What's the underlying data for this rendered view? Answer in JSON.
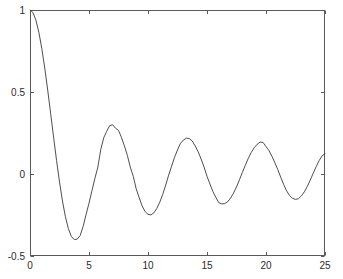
{
  "chart_data": {
    "type": "line",
    "title": "",
    "subtitle": "",
    "xlabel": "",
    "ylabel": "",
    "xlim": [
      0,
      25
    ],
    "ylim": [
      -0.5,
      1
    ],
    "grid": false,
    "legend": null,
    "legend_position": "none",
    "xticks": [
      0,
      5,
      10,
      15,
      20,
      25
    ],
    "xtick_labels": [
      "0",
      "5",
      "10",
      "15",
      "20",
      "25"
    ],
    "yticks": [
      -0.5,
      0,
      0.5,
      1
    ],
    "ytick_labels": [
      "-0.5",
      "0",
      "0.5",
      "1"
    ],
    "line_color": "#3a3a3a",
    "line_width": 0.9,
    "axis_color": "#5a5a5a",
    "background_color": "#ffffff",
    "annotations": [
      {
        "label": "start",
        "x": 0,
        "y": 1.0
      },
      {
        "label": "first-minimum",
        "x": 3.8,
        "y": -0.403
      },
      {
        "label": "first-maximum",
        "x": 6.7,
        "y": 0.3
      },
      {
        "label": "second-minimum",
        "x": 10.0,
        "y": -0.25
      },
      {
        "label": "second-maximum",
        "x": 13.15,
        "y": 0.22
      },
      {
        "label": "third-minimum",
        "x": 16.4,
        "y": -0.18
      },
      {
        "label": "third-maximum",
        "x": 19.5,
        "y": 0.195
      },
      {
        "label": "fourth-minimum",
        "x": 22.6,
        "y": -0.155
      },
      {
        "label": "end",
        "x": 25,
        "y": 0.12
      }
    ],
    "series": [
      {
        "name": "damped oscillation",
        "x": [
          0,
          0.25,
          0.5,
          0.75,
          1,
          1.25,
          1.5,
          1.75,
          2,
          2.25,
          2.5,
          2.75,
          3,
          3.25,
          3.5,
          3.75,
          4,
          4.25,
          4.5,
          4.75,
          5,
          5.25,
          5.5,
          5.75,
          6,
          6.25,
          6.5,
          6.75,
          7,
          7.25,
          7.5,
          7.75,
          8,
          8.25,
          8.5,
          8.75,
          9,
          9.25,
          9.5,
          9.75,
          10,
          10.25,
          10.5,
          10.75,
          11,
          11.25,
          11.5,
          11.75,
          12,
          12.25,
          12.5,
          12.75,
          13,
          13.25,
          13.5,
          13.75,
          14,
          14.25,
          14.5,
          14.75,
          15,
          15.25,
          15.5,
          15.75,
          16,
          16.25,
          16.5,
          16.75,
          17,
          17.25,
          17.5,
          17.75,
          18,
          18.25,
          18.5,
          18.75,
          19,
          19.25,
          19.5,
          19.75,
          20,
          20.25,
          20.5,
          20.75,
          21,
          21.25,
          21.5,
          21.75,
          22,
          22.25,
          22.5,
          22.75,
          23,
          23.25,
          23.5,
          23.75,
          24,
          24.25,
          24.5,
          24.75,
          25
        ],
        "y": [
          1,
          0.9844,
          0.9385,
          0.8642,
          0.7652,
          0.6459,
          0.5118,
          0.369,
          0.2239,
          0.0827,
          -0.0484,
          -0.1641,
          -0.2601,
          -0.3331,
          -0.3801,
          -0.4,
          -0.3971,
          -0.3754,
          -0.3205,
          -0.2478,
          -0.1776,
          -0.1018,
          -0.0268,
          0.042,
          0.1506,
          0.2214,
          0.2601,
          0.2951,
          0.3001,
          0.2786,
          0.2663,
          0.2234,
          0.1717,
          0.1137,
          0.0419,
          -0.0142,
          -0.0903,
          -0.1437,
          -0.1939,
          -0.2289,
          -0.2459,
          -0.2496,
          -0.2366,
          -0.2097,
          -0.1712,
          -0.1237,
          -0.0677,
          -0.0068,
          0.0477,
          0.1021,
          0.1469,
          0.1865,
          0.2069,
          0.2184,
          0.2167,
          0.2007,
          0.1711,
          0.1355,
          0.0917,
          0.0429,
          -0.0142,
          -0.0614,
          -0.1068,
          -0.1422,
          -0.1749,
          -0.1822,
          -0.1806,
          -0.1696,
          -0.1469,
          -0.1161,
          -0.0788,
          -0.0354,
          0.0101,
          0.0534,
          0.0959,
          0.1316,
          0.1601,
          0.1812,
          0.1947,
          0.1925,
          0.167,
          0.1429,
          0.1085,
          0.0687,
          0.0271,
          -0.0203,
          -0.0642,
          -0.1033,
          -0.1313,
          -0.1487,
          -0.1547,
          -0.1506,
          -0.1331,
          -0.1089,
          -0.0758,
          -0.0366,
          0.0042,
          0.0444,
          0.0813,
          0.1104,
          0.1228
        ]
      }
    ]
  },
  "figure": {
    "axes_rect": {
      "left": 30,
      "top": 10,
      "right": 325,
      "bottom": 256
    }
  }
}
